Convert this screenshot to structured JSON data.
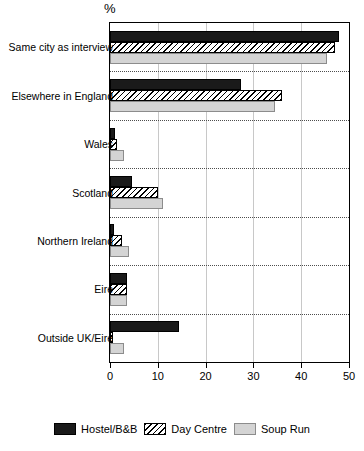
{
  "chart_data": {
    "type": "bar",
    "orientation": "horizontal",
    "title": "",
    "subtitle": "",
    "xlabel": "%",
    "ylabel": "",
    "xlim": [
      0,
      50
    ],
    "xticks": [
      0,
      10,
      20,
      30,
      40,
      50
    ],
    "xtick_labels": [
      "0",
      "10",
      "20",
      "30",
      "40",
      "50"
    ],
    "grid": "dotted group separators, faint vertical gridlines",
    "legend_position": "bottom-center",
    "categories": [
      "Same city as interview",
      "Elsewhere in England",
      "Wales",
      "Scotland",
      "Northern Ireland",
      "Eire",
      "Outside UK/Eire"
    ],
    "series": [
      {
        "name": "Hostel/B&B",
        "color": "#1a1a1a",
        "pattern": "solid",
        "values": [
          48,
          27.5,
          1,
          4.5,
          0.8,
          3.5,
          14.5
        ]
      },
      {
        "name": "Day Centre",
        "color": "#000000",
        "pattern": "diagonal-hatch",
        "values": [
          47,
          36,
          1.5,
          10,
          2.5,
          3.5,
          0.7
        ]
      },
      {
        "name": "Soup Run",
        "color": "#d4d4d4",
        "pattern": "solid-light",
        "values": [
          45.5,
          34.5,
          3,
          11,
          4,
          3.5,
          3
        ]
      }
    ]
  },
  "axis": {
    "unit_label": "%"
  },
  "legend": {
    "items": [
      {
        "label": "Hostel/B&B"
      },
      {
        "label": "Day Centre"
      },
      {
        "label": "Soup Run"
      }
    ]
  }
}
